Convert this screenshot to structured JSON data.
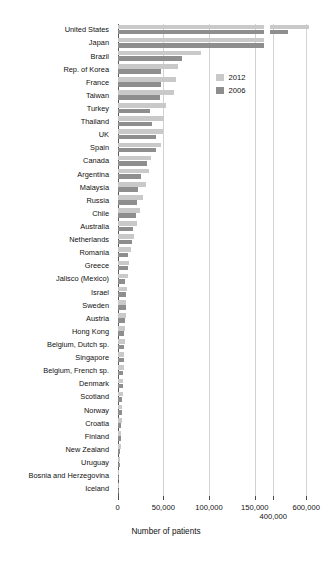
{
  "chart_data": {
    "type": "bar",
    "orientation": "horizontal",
    "title": "",
    "xlabel": "Number of patients",
    "ylabel": "",
    "grid": true,
    "legend_position": "upper-right",
    "broken_axis": true,
    "axis_segments": [
      {
        "name": "lower",
        "range": [
          0,
          160000
        ],
        "ticks": [
          0,
          50000,
          100000,
          150000
        ],
        "tick_labels": [
          "0",
          "50,000",
          "100,000",
          "150,000"
        ]
      },
      {
        "name": "upper",
        "range": [
          380000,
          660000
        ],
        "ticks": [
          400000,
          600000
        ],
        "tick_labels": [
          "400,000",
          "600,000"
        ]
      }
    ],
    "categories": [
      "United States",
      "Japan",
      "Brazil",
      "Rep. of Korea",
      "France",
      "Taiwan",
      "Turkey",
      "Thailand",
      "UK",
      "Spain",
      "Canada",
      "Argentina",
      "Malaysia",
      "Russia",
      "Chile",
      "Australia",
      "Netherlands",
      "Romania",
      "Greece",
      "Jalisco (Mexico)",
      "Israel",
      "Sweden",
      "Austria",
      "Hong Kong",
      "Belgium, Dutch sp.",
      "Singapore",
      "Belgium, French sp.",
      "Denmark",
      "Scotland",
      "Norway",
      "Croatia",
      "Finland",
      "New Zealand",
      "Uruguay",
      "Bosnia and Herzegovina",
      "Iceland"
    ],
    "series": [
      {
        "name": "2012",
        "color": "#c9c9c9",
        "values": [
          615000,
          310000,
          91000,
          66000,
          64000,
          62000,
          53000,
          51000,
          50000,
          48000,
          37000,
          34000,
          31000,
          28000,
          25000,
          21000,
          18000,
          15000,
          13000,
          11500,
          10500,
          9800,
          9200,
          8600,
          8000,
          7400,
          6800,
          6200,
          5600,
          5000,
          4500,
          4000,
          3400,
          2800,
          2000,
          600
        ]
      },
      {
        "name": "2006",
        "color": "#8e8e8e",
        "values": [
          487000,
          258000,
          70000,
          47000,
          47000,
          46000,
          36000,
          38000,
          42000,
          42000,
          32000,
          26000,
          22000,
          21000,
          20000,
          17000,
          16000,
          11000,
          11000,
          8500,
          9500,
          8800,
          8400,
          7400,
          7300,
          6600,
          6200,
          5600,
          5200,
          4600,
          3800,
          3600,
          3000,
          2400,
          1500,
          450
        ]
      }
    ]
  },
  "legend": {
    "items": [
      {
        "label": "2012",
        "color": "#c9c9c9"
      },
      {
        "label": "2006",
        "color": "#8e8e8e"
      }
    ]
  },
  "axis": {
    "x_title": "Number of patients"
  }
}
